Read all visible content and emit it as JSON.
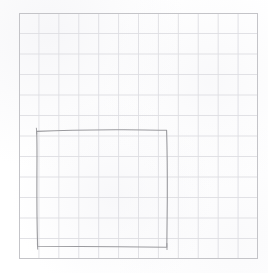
{
  "document": {
    "kind": "grid-paper-sketch",
    "description": "Hand-drawn square on light graph paper",
    "width": 268,
    "height": 273,
    "background_color": "#ffffff"
  },
  "grid": {
    "label": "graph-paper-grid",
    "left": 19,
    "top": 13,
    "right": 258,
    "bottom": 259,
    "columns": 12,
    "rows": 12,
    "cell_width": 19.9,
    "cell_height": 20.5,
    "line_color": "#dedee2",
    "line_width": 0.9,
    "border_color": "#c4c4c8",
    "border_width": 1.0
  },
  "sketch": {
    "label": "hand-drawn-square",
    "stroke_color": "#9a9a9e",
    "stroke_width": 1.1,
    "corners": [
      {
        "name": "top-left",
        "x": 37,
        "y": 130
      },
      {
        "name": "top-right",
        "x": 167,
        "y": 130
      },
      {
        "name": "bottom-right",
        "x": 167,
        "y": 247
      },
      {
        "name": "bottom-left",
        "x": 38,
        "y": 246
      }
    ],
    "path": "M 36.6 131.4 C 60 130.2, 96 129.6, 124 129.7 C 142 129.8, 158 130.0, 166.6 130.3 C 167.2 150, 167.4 176, 167.3 200 C 167.2 220, 167.0 238, 166.8 247.3 C 140 247.0, 108 246.6, 80 246.5 C 62 246.4, 46 246.4, 37.6 246.3 C 37.0 226, 36.8 200, 36.9 176 C 37.0 156, 37.2 140, 36.6 131.4",
    "overshoots": [
      {
        "name": "top-left-overshoot",
        "path": "M 36.4 128.2 L 36.8 134.0"
      },
      {
        "name": "bottom-right-overshoot",
        "path": "M 166.9 243.5 L 167.0 249.6"
      },
      {
        "name": "bottom-left-tail",
        "path": "M 37.4 244.0 L 37.7 249.2"
      }
    ]
  }
}
